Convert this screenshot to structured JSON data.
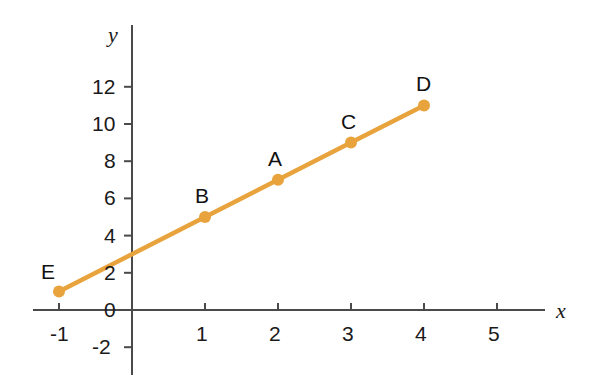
{
  "chart_data": {
    "type": "line",
    "title": "",
    "xlabel": "x",
    "ylabel": "y",
    "xlim": [
      -1.6,
      5.9
    ],
    "ylim": [
      -3.2,
      13.6
    ],
    "grid": false,
    "legend": "none",
    "line_color": "#E8A33D",
    "axis_color": "#4a4a4a",
    "x_ticks": [
      "-1",
      "1",
      "2",
      "3",
      "4",
      "5"
    ],
    "x_tick_values": [
      -1,
      1,
      2,
      3,
      4,
      5
    ],
    "y_ticks": [
      "12",
      "10",
      "8",
      "6",
      "4",
      "2",
      "0",
      "-2"
    ],
    "y_tick_values": [
      12,
      10,
      8,
      6,
      4,
      2,
      0,
      -2
    ],
    "origin_label": "0",
    "equation": "y = 2x + 3",
    "x": [
      -1,
      1,
      2,
      3,
      4
    ],
    "values": [
      1,
      5,
      7,
      9,
      11
    ],
    "points": [
      {
        "label": "E",
        "x": -1,
        "y": 1,
        "label_dx": -18,
        "label_dy": -30
      },
      {
        "label": "B",
        "x": 1,
        "y": 5,
        "label_dx": -10,
        "label_dy": -32
      },
      {
        "label": "A",
        "x": 2,
        "y": 7,
        "label_dx": -10,
        "label_dy": -32
      },
      {
        "label": "C",
        "x": 3,
        "y": 9,
        "label_dx": -10,
        "label_dy": -32
      },
      {
        "label": "D",
        "x": 4,
        "y": 11,
        "label_dx": -8,
        "label_dy": -32
      }
    ]
  },
  "geometry": {
    "origin_px_x": 132,
    "origin_px_y": 310,
    "x_scale_px": 73,
    "y_scale_px": 18.6,
    "x_axis_left_px": 33,
    "x_axis_right_px": 545,
    "y_axis_top_px": 25,
    "y_axis_bottom_px": 375,
    "point_radius": 6,
    "line_width": 4.5
  }
}
